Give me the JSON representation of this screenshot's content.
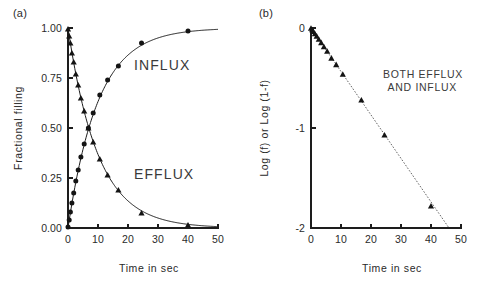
{
  "figure": {
    "width": 486,
    "height": 289,
    "background": "#ffffff",
    "ink_color": "#1d1d1d",
    "annotation_color": "#3a3a3a"
  },
  "panels": [
    {
      "key": "a",
      "label": "(a)",
      "name": "panel-a"
    },
    {
      "key": "b",
      "label": "(b)",
      "name": "panel-b"
    }
  ],
  "chart_data": [
    {
      "panel": "(a)",
      "type": "scatter",
      "title": "",
      "xlabel": "Time in sec",
      "ylabel": "Fractional filling",
      "xlim": [
        0,
        50
      ],
      "ylim": [
        0.0,
        1.0
      ],
      "xticks": [
        0,
        10,
        20,
        30,
        40,
        50
      ],
      "xticklabels": [
        "0",
        "10",
        "20",
        "30",
        "40",
        "50"
      ],
      "yticks": [
        0.0,
        0.25,
        0.5,
        0.75,
        1.0
      ],
      "yticklabels": [
        "0.00",
        "0.25",
        "0.50",
        "0.75",
        "1.00"
      ],
      "grid": false,
      "legend": "none",
      "annotations": [
        {
          "text": "INFLUX",
          "x": 22,
          "y": 0.79
        },
        {
          "text": "EFFLUX",
          "x": 22,
          "y": 0.245
        }
      ],
      "series": [
        {
          "name": "INFLUX",
          "marker": "circle",
          "fit": "solid",
          "model": "1 - exp(-k t)",
          "k": 0.1,
          "x": [
            0.0,
            0.4,
            0.8,
            1.3,
            1.9,
            2.6,
            3.4,
            4.3,
            5.4,
            6.8,
            8.4,
            10.6,
            13.2,
            16.8,
            24.5,
            40.0
          ],
          "values": [
            0.005,
            0.04,
            0.08,
            0.125,
            0.175,
            0.235,
            0.29,
            0.355,
            0.42,
            0.5,
            0.575,
            0.665,
            0.74,
            0.81,
            0.925,
            0.985
          ]
        },
        {
          "name": "EFFLUX",
          "marker": "triangle",
          "fit": "solid",
          "model": "exp(-k t)",
          "k": 0.1,
          "x": [
            0.0,
            0.4,
            0.8,
            1.3,
            1.9,
            2.6,
            3.4,
            4.3,
            5.4,
            6.8,
            8.4,
            10.6,
            13.2,
            16.8,
            24.5,
            40.0
          ],
          "values": [
            0.995,
            0.96,
            0.925,
            0.875,
            0.83,
            0.77,
            0.715,
            0.65,
            0.585,
            0.5,
            0.43,
            0.345,
            0.265,
            0.19,
            0.075,
            0.015
          ]
        }
      ]
    },
    {
      "panel": "(b)",
      "type": "scatter",
      "title": "",
      "xlabel": "Time in sec",
      "ylabel": "Log (f) or Log (1-f)",
      "xlim": [
        0,
        50
      ],
      "ylim": [
        -2,
        0
      ],
      "xticks": [
        0,
        10,
        20,
        30,
        40,
        50
      ],
      "xticklabels": [
        "0",
        "10",
        "20",
        "30",
        "40",
        "50"
      ],
      "yticks": [
        0,
        -1,
        -2
      ],
      "yticklabels": [
        "0",
        "-1",
        "-2"
      ],
      "grid": false,
      "legend": "none",
      "annotations": [
        {
          "text": "BOTH EFFLUX",
          "x": 24,
          "y": -0.5
        },
        {
          "text": "AND INFLUX",
          "x": 25.5,
          "y": -0.63
        }
      ],
      "series": [
        {
          "name": "BOTH EFFLUX AND INFLUX",
          "marker": "triangle",
          "fit": "dotted",
          "model": "linear",
          "slope": -0.0435,
          "intercept": 0.0,
          "x": [
            0.0,
            0.4,
            0.8,
            1.3,
            1.9,
            2.6,
            3.4,
            4.3,
            5.4,
            6.8,
            8.4,
            10.6,
            16.8,
            24.5,
            40.0
          ],
          "values": [
            -0.002,
            -0.018,
            -0.034,
            -0.058,
            -0.081,
            -0.113,
            -0.146,
            -0.187,
            -0.233,
            -0.301,
            -0.366,
            -0.462,
            -0.72,
            -1.07,
            -1.78
          ]
        }
      ],
      "fit_line": {
        "x": [
          0,
          46
        ],
        "values": [
          0.0,
          -2.0
        ]
      }
    }
  ]
}
